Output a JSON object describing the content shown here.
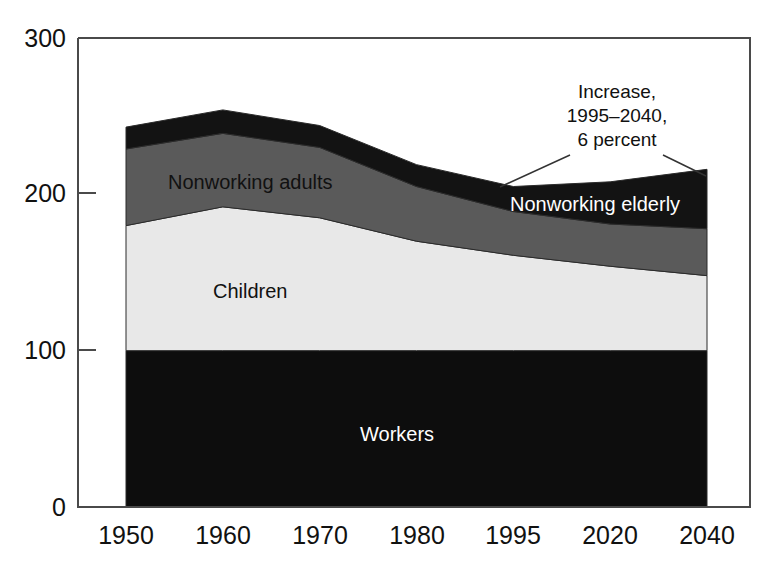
{
  "chart_data": {
    "type": "area",
    "title": "",
    "subtitle": "",
    "xlabel": "",
    "ylabel": "",
    "stacked": true,
    "grid": false,
    "legend_position": "inline-labels",
    "categories": [
      "1950",
      "1960",
      "1970",
      "1980",
      "1995",
      "2020",
      "2040"
    ],
    "x": [
      "1950",
      "1960",
      "1970",
      "1980",
      "1995",
      "2020",
      "2040"
    ],
    "ylim": [
      0,
      300
    ],
    "yticks": [
      0,
      100,
      200,
      300
    ],
    "ytick_labels": [
      "0",
      "100",
      "200",
      "300"
    ],
    "series": [
      {
        "name": "Workers",
        "color": "#0d0d0d",
        "values": [
          100,
          100,
          100,
          100,
          100,
          100,
          100
        ]
      },
      {
        "name": "Children",
        "color": "#e8e8e8",
        "values": [
          80,
          92,
          85,
          70,
          61,
          54,
          48
        ]
      },
      {
        "name": "Nonworking adults",
        "color": "#5a5a5a",
        "values": [
          49,
          47,
          45,
          35,
          28,
          27,
          30
        ]
      },
      {
        "name": "Nonworking elderly",
        "color": "#131313",
        "values": [
          14,
          15,
          14,
          14,
          16,
          27,
          38
        ]
      }
    ],
    "cumulative_tops": {
      "workers": [
        100,
        100,
        100,
        100,
        100,
        100,
        100
      ],
      "children": [
        180,
        192,
        185,
        170,
        161,
        154,
        148
      ],
      "nonworking_adults": [
        229,
        239,
        230,
        205,
        189,
        181,
        178
      ],
      "nonworking_elderly": [
        243,
        254,
        244,
        219,
        205,
        208,
        216
      ]
    },
    "annotations": [
      {
        "id": "increase-callout",
        "lines": [
          "Increase,",
          "1995–2040,",
          "6 percent"
        ],
        "text": "Increase, 1995–2040, 6 percent",
        "points_to": [
          "1995",
          "2040"
        ]
      }
    ],
    "inline_labels": [
      {
        "id": "label-nonworking-adults",
        "text": "Nonworking adults",
        "tone": "dark"
      },
      {
        "id": "label-children",
        "text": "Children",
        "tone": "dark"
      },
      {
        "id": "label-workers",
        "text": "Workers",
        "tone": "light"
      },
      {
        "id": "label-nonworking-elderly",
        "text": "Nonworking elderly",
        "tone": "light"
      }
    ]
  },
  "axes": {
    "y_labels": [
      "300",
      "200",
      "100",
      "0"
    ],
    "x_labels": [
      "1950",
      "1960",
      "1970",
      "1980",
      "1995",
      "2020",
      "2040"
    ]
  },
  "annotation": {
    "line1": "Increase,",
    "line2": "1995–2040,",
    "line3": "6 percent"
  },
  "labels": {
    "nonworking_adults": "Nonworking adults",
    "children": "Children",
    "workers": "Workers",
    "nonworking_elderly": "Nonworking elderly"
  },
  "colors": {
    "workers": "#0d0d0d",
    "children": "#e8e8e8",
    "nonworking_adults": "#5a5a5a",
    "nonworking_elderly": "#131313",
    "frame": "#4a4a4a",
    "text": "#111111"
  }
}
